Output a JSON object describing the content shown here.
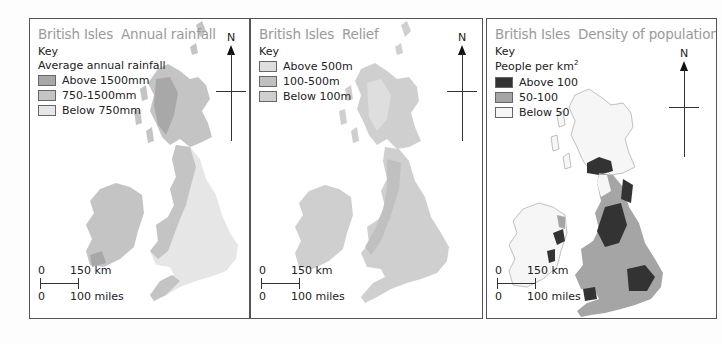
{
  "maps": [
    {
      "title": "British Isles",
      "subtitle": "Annual rainfall",
      "key_label": "Key",
      "key_heading": "Average annual rainfall",
      "legend": [
        {
          "label": "Above 1500mm",
          "color": "#a8a8a8"
        },
        {
          "label": "750-1500mm",
          "color": "#c4c4c4"
        },
        {
          "label": "Below 750mm",
          "color": "#e6e6e6"
        }
      ],
      "north_label": "N",
      "scale": {
        "km_zero": "0",
        "km_label": "150 km",
        "mi_zero": "0",
        "mi_label": "100 miles"
      }
    },
    {
      "title": "British Isles",
      "subtitle": "Relief",
      "key_label": "Key",
      "legend": [
        {
          "label": "Above 500m",
          "color": "#dedede"
        },
        {
          "label": "100-500m",
          "color": "#c0c0c0"
        },
        {
          "label": "Below 100m",
          "color": "#cfcfcf"
        }
      ],
      "north_label": "N",
      "scale": {
        "km_zero": "0",
        "km_label": "150 km",
        "mi_zero": "0",
        "mi_label": "100 miles"
      }
    },
    {
      "title": "British Isles",
      "subtitle": "Density of population",
      "key_label": "Key",
      "key_heading": "People per km",
      "key_heading_sup": "2",
      "legend": [
        {
          "label": "Above 100",
          "color": "#333333"
        },
        {
          "label": "50-100",
          "color": "#a5a5a5"
        },
        {
          "label": "Below 50",
          "color": "#f6f6f6"
        }
      ],
      "north_label": "N",
      "scale": {
        "km_zero": "0",
        "km_label": "150 km",
        "mi_zero": "0",
        "mi_label": "100 miles"
      }
    }
  ]
}
